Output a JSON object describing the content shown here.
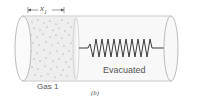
{
  "diagram": {
    "dimension_label": "x",
    "dimension_subscript": "1",
    "gas_label": "Gas 1",
    "evacuated_label": "Evacuated",
    "panel_label": "(b)",
    "colors": {
      "tube_outline": "#bdbdbd",
      "tube_fill": "#f7f7f7",
      "spring": "#333333",
      "dots": "#888888",
      "text": "#555555"
    }
  }
}
